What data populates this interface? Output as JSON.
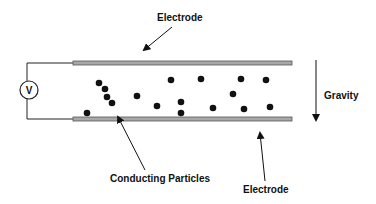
{
  "labels": {
    "electrode_top": "Electrode",
    "electrode_bottom": "Electrode",
    "gravity": "Gravity",
    "particles": "Conducting Particles",
    "voltmeter": "V"
  },
  "colors": {
    "electrode_fill": "#a8a8a8",
    "electrode_stroke": "#555555",
    "ink": "#111111"
  },
  "particles": [
    [
      99,
      83
    ],
    [
      105,
      89
    ],
    [
      107,
      97
    ],
    [
      112,
      103
    ],
    [
      87,
      113
    ],
    [
      137,
      96
    ],
    [
      157,
      106
    ],
    [
      171,
      80
    ],
    [
      181,
      102
    ],
    [
      181,
      113
    ],
    [
      201,
      79
    ],
    [
      241,
      79
    ],
    [
      266,
      80
    ],
    [
      233,
      94
    ],
    [
      213,
      108
    ],
    [
      244,
      109
    ],
    [
      270,
      107
    ]
  ]
}
